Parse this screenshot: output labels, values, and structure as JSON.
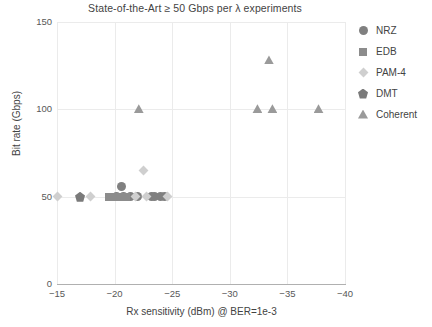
{
  "chart_data": {
    "type": "scatter",
    "title": "State-of-the-Art ≥ 50 Gbps per λ experiments",
    "xlabel": "Rx sensitivity (dBm) @ BER=1e-3",
    "ylabel": "Bit rate (Gbps)",
    "xlim": [
      -15,
      -40
    ],
    "ylim": [
      0,
      150
    ],
    "x_reversed": true,
    "xticks": [
      "−15",
      "−20",
      "−25",
      "−30",
      "−35",
      "−40"
    ],
    "xtick_values": [
      -15,
      -20,
      -25,
      -30,
      -35,
      -40
    ],
    "yticks": [
      "0",
      "50",
      "100",
      "150"
    ],
    "ytick_values": [
      0,
      50,
      100,
      150
    ],
    "grid": true,
    "grid_color": "#ebebeb",
    "legend_position": "right",
    "series": [
      {
        "name": "NRZ",
        "marker": "circle",
        "color": "#808080",
        "points": [
          {
            "x": -20.6,
            "y": 56
          },
          {
            "x": -20.2,
            "y": 50
          },
          {
            "x": -20.8,
            "y": 50
          },
          {
            "x": -21.4,
            "y": 50
          },
          {
            "x": -22.0,
            "y": 50
          },
          {
            "x": -23.2,
            "y": 50
          },
          {
            "x": -23.5,
            "y": 50
          },
          {
            "x": -24.0,
            "y": 50
          },
          {
            "x": -24.3,
            "y": 50
          }
        ]
      },
      {
        "name": "EDB",
        "marker": "square",
        "color": "#8c8c8c",
        "points": [
          {
            "x": -19.5,
            "y": 50
          },
          {
            "x": -19.9,
            "y": 50
          },
          {
            "x": -20.4,
            "y": 50
          },
          {
            "x": -21.0,
            "y": 50
          }
        ]
      },
      {
        "name": "PAM-4",
        "marker": "diamond",
        "color": "#cfcfcf",
        "points": [
          {
            "x": -15.0,
            "y": 50
          },
          {
            "x": -17.9,
            "y": 50
          },
          {
            "x": -22.5,
            "y": 65
          },
          {
            "x": -21.8,
            "y": 50
          },
          {
            "x": -22.8,
            "y": 50
          },
          {
            "x": -24.6,
            "y": 50
          }
        ]
      },
      {
        "name": "DMT",
        "marker": "pentagon",
        "color": "#7a7a7a",
        "points": [
          {
            "x": -17.0,
            "y": 50
          }
        ]
      },
      {
        "name": "Coherent",
        "marker": "triangle",
        "color": "#9a9a9a",
        "points": [
          {
            "x": -22.1,
            "y": 100
          },
          {
            "x": -32.4,
            "y": 100
          },
          {
            "x": -33.7,
            "y": 100
          },
          {
            "x": -37.7,
            "y": 100
          },
          {
            "x": -33.4,
            "y": 128
          }
        ]
      }
    ]
  }
}
